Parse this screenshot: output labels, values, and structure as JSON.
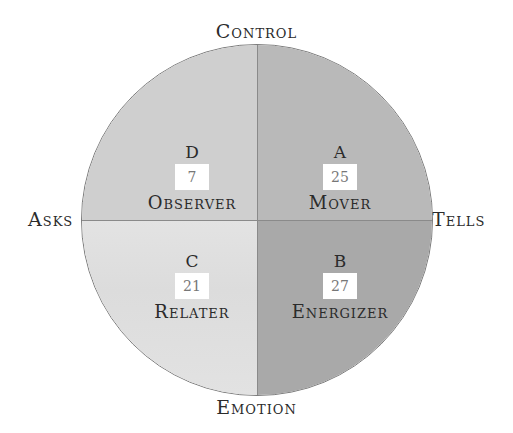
{
  "axes": {
    "top": "Control",
    "bottom": "Emotion",
    "left": "Asks",
    "right": "Tells"
  },
  "quadrants": {
    "top_left": {
      "letter": "D",
      "score": "7",
      "name": "Observer",
      "color": "#cfcfcf"
    },
    "top_right": {
      "letter": "A",
      "score": "25",
      "name": "Mover",
      "color": "#b9b9b9"
    },
    "bottom_left": {
      "letter": "C",
      "score": "21",
      "name": "Relater",
      "color": "#e2e2e2"
    },
    "bottom_right": {
      "letter": "B",
      "score": "27",
      "name": "Energizer",
      "color": "#a9a9a9"
    }
  }
}
